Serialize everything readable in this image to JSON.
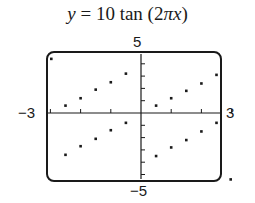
{
  "chart_data": {
    "type": "scatter",
    "title": "y = 10 tan (2πx)",
    "title_parts": {
      "y": "y",
      "eq": " = 10 tan (2",
      "pi": "π",
      "x": "x",
      "close": ")"
    },
    "xlabel": "",
    "ylabel": "",
    "xlim": [
      -3,
      3
    ],
    "ylim": [
      -5,
      5
    ],
    "x_tick_labels": {
      "min": "−3",
      "max": "3"
    },
    "y_tick_labels": {
      "min": "−5",
      "max": "5"
    },
    "x_tick_step": 1,
    "y_tick_step": 1,
    "grid": false,
    "legend": null,
    "style": "graphing-calculator window, dot mode",
    "series": [
      {
        "name": "y = 10 tan(2πx) (dot mode samples)",
        "points": [
          [
            -2.97,
            4.4
          ],
          [
            -2.5,
            0.6
          ],
          [
            -2.0,
            1.2
          ],
          [
            -1.5,
            1.9
          ],
          [
            -1.0,
            2.5
          ],
          [
            -0.5,
            3.2
          ],
          [
            0.5,
            0.6
          ],
          [
            1.0,
            1.2
          ],
          [
            1.5,
            1.8
          ],
          [
            2.0,
            2.4
          ],
          [
            2.5,
            3.1
          ],
          [
            -2.5,
            -3.4
          ],
          [
            -2.0,
            -2.7
          ],
          [
            -1.5,
            -2.1
          ],
          [
            -1.0,
            -1.4
          ],
          [
            -0.5,
            -0.8
          ],
          [
            0.5,
            -3.5
          ],
          [
            1.0,
            -2.8
          ],
          [
            1.5,
            -2.2
          ],
          [
            2.0,
            -1.5
          ],
          [
            2.5,
            -0.8
          ],
          [
            2.97,
            -5.4
          ]
        ]
      }
    ]
  },
  "colors": {
    "ink": "#1a1a1a",
    "background": "#ffffff"
  }
}
